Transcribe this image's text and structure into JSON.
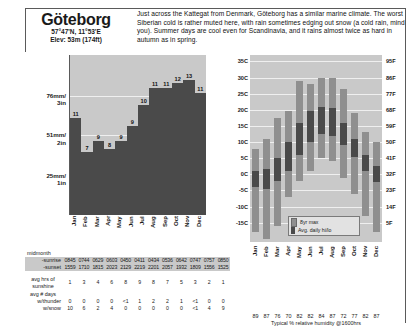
{
  "header": {
    "city": "Göteborg",
    "coords": "57°47'N, 11°53'E",
    "elevation": "Elev: 53m (174ft)",
    "blurb": "Just across the Kattegat from Denmark, Göteborg has a similar marine climate. The worst Siberian cold is rather muted here, with rain sometimes edging out snow (a cold rain, mind you). Summer days are cool even for Scandinavia, and it rains almost twice as hard in autumn as in spring."
  },
  "precip_legend": {
    "title": "No. of wet days >1.0mm",
    "swatch_label": "Avg. monthly precipitation"
  },
  "temp_legend": {
    "max_label": "8yr max",
    "avg_label": "Avg. daily hi/lo"
  },
  "sun_table": {
    "midmonth_label": "midmonth",
    "sunrise_label": "-sunrise",
    "sunset_label": "-sunset",
    "sunshine_label": "avg hrs of sunshine",
    "days_label": "avg # days",
    "thunder_label": "w/thunder",
    "snow_label": "w/snow",
    "sunrise": [
      "0845",
      "0744",
      "0629",
      "0603",
      "0450",
      "0411",
      "0434",
      "0536",
      "0642",
      "0747",
      "0757",
      "0850"
    ],
    "sunset": [
      "1559",
      "1710",
      "1815",
      "2023",
      "2129",
      "2219",
      "2201",
      "2057",
      "1932",
      "1809",
      "1556",
      "1525"
    ],
    "sunshine": [
      "1",
      "3",
      "4",
      "6",
      "8",
      "9",
      "8",
      "7",
      "5",
      "3",
      "2",
      "1"
    ],
    "thunder": [
      "0",
      "0",
      "0",
      "0",
      "<1",
      "1",
      "2",
      "2",
      "1",
      "<1",
      "0",
      "0"
    ],
    "snow": [
      "10",
      "6",
      "2",
      "4",
      "0",
      "0",
      "0",
      "0",
      "0",
      "<1",
      "4",
      "9"
    ]
  },
  "humidity": {
    "caption": "Typical % relative humidity @1600hrs",
    "values": [
      89,
      87,
      76,
      70,
      82,
      82,
      84,
      87,
      72,
      77,
      82,
      87
    ]
  },
  "chart_data": [
    {
      "type": "bar",
      "name": "precipitation",
      "title": "Avg. monthly precipitation",
      "categories": [
        "Jan",
        "Feb",
        "Mar",
        "Apr",
        "May",
        "Jun",
        "Jul",
        "Aug",
        "Sep",
        "Oct",
        "Nov",
        "Dec"
      ],
      "values": [
        62,
        40,
        47,
        42,
        47,
        57,
        70,
        81,
        81,
        84,
        86,
        78
      ],
      "unit": "mm",
      "wet_days": [
        11,
        7,
        9,
        8,
        9,
        9,
        10,
        11,
        11,
        12,
        13,
        11
      ],
      "ylabel": "",
      "ytick_labels": [
        "76mm/ 3in",
        "51mm/ 2in",
        "25mm/ 1in"
      ],
      "ytick_values": [
        76,
        51,
        25
      ],
      "ylim": [
        0,
        102
      ],
      "grid": true
    },
    {
      "type": "bar",
      "name": "temperature",
      "title": "Avg. daily hi/lo and 8yr max/min",
      "categories": [
        "Jan",
        "Feb",
        "Mar",
        "Apr",
        "May",
        "Jun",
        "Jul",
        "Aug",
        "Sep",
        "Oct",
        "Nov",
        "Dec"
      ],
      "series": [
        {
          "name": "8yr max",
          "values": [
            8.0,
            11.0,
            17.5,
            19.5,
            29.0,
            28.0,
            30.0,
            30.0,
            26.5,
            19.0,
            13.0,
            10.0
          ]
        },
        {
          "name": "avg daily high",
          "values": [
            1.0,
            1.5,
            5.0,
            10.0,
            16.0,
            19.5,
            21.0,
            20.5,
            16.0,
            11.0,
            6.0,
            2.5
          ]
        },
        {
          "name": "avg daily low",
          "values": [
            -4.0,
            -4.5,
            -2.0,
            1.0,
            6.0,
            10.0,
            12.5,
            12.0,
            9.0,
            5.5,
            1.0,
            -2.5
          ]
        },
        {
          "name": "8yr min",
          "values": [
            -18.0,
            -20.0,
            -16.0,
            -7.0,
            -2.0,
            1.0,
            5.0,
            4.0,
            -1.0,
            -6.0,
            -13.0,
            -18.0
          ]
        }
      ],
      "c_ticks": [
        "35C",
        "30C",
        "25C",
        "20C",
        "15C",
        "10C",
        "5C",
        "0C",
        "-5C",
        "-10C",
        "-15C"
      ],
      "c_values": [
        35,
        30,
        25,
        20,
        15,
        10,
        5,
        0,
        -5,
        -10,
        -15
      ],
      "f_ticks": [
        "95F",
        "86F",
        "77F",
        "68F",
        "59F",
        "50F",
        "41F",
        "32F",
        "23F",
        "14F",
        "5F"
      ],
      "f_values": [
        95,
        86,
        77,
        68,
        59,
        50,
        41,
        32,
        23,
        14,
        5
      ],
      "ylim": [
        -21,
        37
      ],
      "grid": true
    }
  ]
}
